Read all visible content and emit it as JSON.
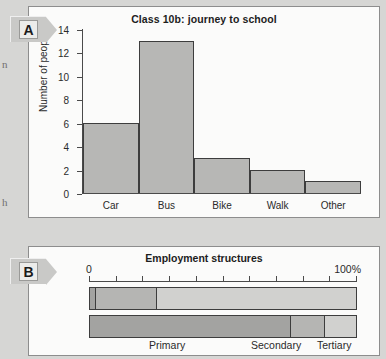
{
  "margin_fragments": [
    "n",
    "h"
  ],
  "panel_a": {
    "marker": "A",
    "chart_data": {
      "type": "bar",
      "title": "Class 10b: journey to school",
      "xlabel": "",
      "ylabel": "Number of people",
      "categories": [
        "Car",
        "Bus",
        "Bike",
        "Walk",
        "Other"
      ],
      "values": [
        6,
        13,
        3,
        2,
        1
      ],
      "ylim": [
        0,
        14
      ],
      "yticks": [
        14,
        12,
        10,
        8,
        6,
        4,
        2,
        0
      ],
      "grid": false,
      "legend": "none",
      "bar_fill": "#b7b7b5",
      "bar_stroke": "#3d3d3d"
    }
  },
  "panel_b": {
    "marker": "B",
    "chart_data": {
      "type": "bar",
      "orientation": "horizontal-stacked",
      "title": "Employment structures",
      "xlabel": "",
      "ylabel": "",
      "scale_start_label": "0",
      "scale_end_label": "100%",
      "xlim": [
        0,
        100
      ],
      "xticks": [
        0,
        10,
        20,
        30,
        40,
        50,
        60,
        70,
        80,
        90,
        100
      ],
      "categories": [
        "UK",
        "Kenya"
      ],
      "series": [
        {
          "name": "Primary",
          "values": [
            2,
            75
          ],
          "color": "#a3a3a1"
        },
        {
          "name": "Secondary",
          "values": [
            23,
            13
          ],
          "color": "#b5b5b3"
        },
        {
          "name": "Tertiary",
          "values": [
            75,
            12
          ],
          "color": "#d1d1cf"
        }
      ],
      "segment_labels": [
        "Primary",
        "Secondary",
        "Tertiary"
      ],
      "grid": false,
      "legend": "bottom-inline"
    }
  }
}
